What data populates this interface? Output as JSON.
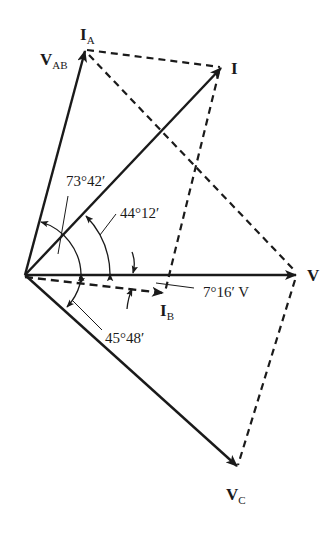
{
  "diagram": {
    "type": "phasor-diagram",
    "colors": {
      "stroke": "#1a1a1a",
      "background": "#ffffff"
    },
    "origin": {
      "x": 25,
      "y": 275
    },
    "phasors": [
      {
        "id": "VAB",
        "main": "V",
        "sub": "AB",
        "tip": [
          85,
          50
        ],
        "style": "solid"
      },
      {
        "id": "I",
        "main": "I",
        "sub": "",
        "tip": [
          222,
          67
        ],
        "style": "solid"
      },
      {
        "id": "V",
        "main": "V",
        "sub": "",
        "tip": [
          297,
          275
        ],
        "style": "solid"
      },
      {
        "id": "IB",
        "main": "I",
        "sub": "B",
        "tip": [
          163,
          293
        ],
        "style": "dashed"
      },
      {
        "id": "VC",
        "main": "V",
        "sub": "C",
        "tip": [
          238,
          467
        ],
        "style": "solid"
      }
    ],
    "labels": {
      "ia_main": "I",
      "ia_sub": "A",
      "vab_main": "V",
      "vab_sub": "AB",
      "i_main": "I",
      "v_main": "V",
      "ib_main": "I",
      "ib_sub": "B",
      "vc_main": "V",
      "vc_sub": "C"
    },
    "angles": {
      "a1": "73°42′",
      "a2": "44°12′",
      "a3": "7°16′ V",
      "a4": "45°48′"
    },
    "dashed_lines": [
      {
        "from": "IA",
        "to": "I"
      },
      {
        "from": "IA",
        "to": "V"
      },
      {
        "from": "I",
        "to": "IB"
      },
      {
        "from": "V",
        "to": "VC"
      }
    ]
  }
}
